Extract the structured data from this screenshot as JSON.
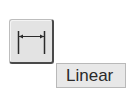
{
  "tool": {
    "icon": "linear-dimension-icon",
    "tooltip": "Linear"
  },
  "colors": {
    "button_bg": "#e3e3e3",
    "button_shadow": "#4a4a4a",
    "tooltip_bg": "#e8e8e8",
    "text": "#2a2a2a"
  }
}
